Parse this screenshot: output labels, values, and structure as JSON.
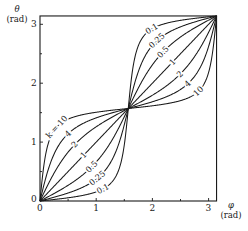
{
  "chart_data": {
    "type": "line",
    "title": "",
    "xlabel": "φ",
    "xlabel_unit": "(rad)",
    "ylabel": "θ",
    "ylabel_unit": "(rad)",
    "xlim": [
      0,
      3.1416
    ],
    "ylim": [
      0,
      3.1416
    ],
    "x_ticks": [
      "0",
      "1",
      "2",
      "3"
    ],
    "y_ticks": [
      "0",
      "1",
      "2",
      "3"
    ],
    "grid": false,
    "legend": "inline curve labels",
    "relation": "tan(theta) = k * tan(phi)",
    "series": [
      {
        "name": "k = 10",
        "k": 10,
        "label": "k = 10"
      },
      {
        "name": "4",
        "k": 4,
        "label": "4"
      },
      {
        "name": "2",
        "k": 2,
        "label": "2"
      },
      {
        "name": "1",
        "k": 1,
        "label": "1"
      },
      {
        "name": "0.5",
        "k": 0.5,
        "label": "0.5"
      },
      {
        "name": "0.25",
        "k": 0.25,
        "label": "0.25"
      },
      {
        "name": "0.1",
        "k": 0.1,
        "label": "0.1"
      }
    ],
    "upper_half_labels": [
      "0.1",
      "0.25",
      "0.5",
      "1",
      "2",
      "4",
      "10"
    ]
  },
  "colors": {
    "line": "#1a1a1a",
    "background": "#ffffff"
  }
}
